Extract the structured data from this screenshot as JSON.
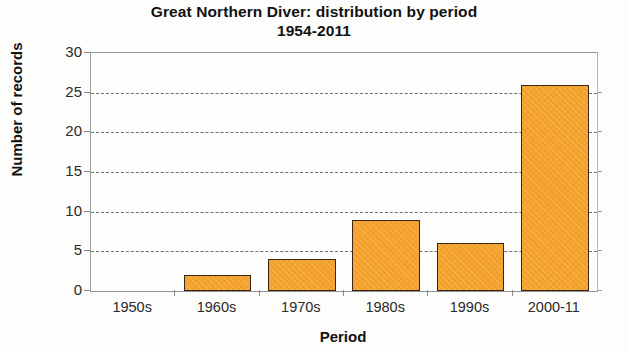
{
  "chart_data": {
    "type": "bar",
    "title": "Great Northern Diver: distribution by period\n1954-2011",
    "title_line1": "Great Northern Diver: distribution by period",
    "title_line2": "1954-2011",
    "xlabel": "Period",
    "ylabel": "Number of records",
    "categories": [
      "1950s",
      "1960s",
      "1970s",
      "1980s",
      "1990s",
      "2000-11"
    ],
    "values": [
      0,
      2,
      4,
      9,
      6,
      26
    ],
    "ylim": [
      0,
      30
    ],
    "ytick_step": 5,
    "yticks": [
      0,
      5,
      10,
      15,
      20,
      25,
      30
    ],
    "ytick_labels": [
      "0",
      "5",
      "10",
      "15",
      "20",
      "25",
      "30"
    ],
    "grid": "horizontal-dashed",
    "legend": "none",
    "bar_color": "#f4a22c",
    "bar_border_color": "#3b2512",
    "background_color": "#fdfdfc",
    "gridline_color": "#6e6e6e"
  }
}
